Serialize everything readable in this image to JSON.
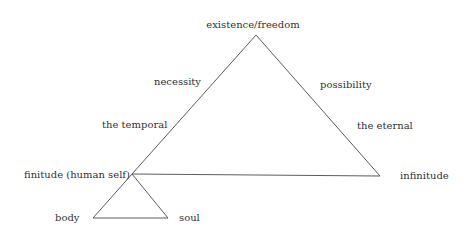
{
  "diagram": {
    "colors": {
      "line": "#4a4a4a",
      "text": "#333333",
      "background": "#ffffff"
    },
    "labels": {
      "apex": "existence/freedom",
      "left_upper": "necessity",
      "right_upper": "possibility",
      "left_lower": "the temporal",
      "right_lower": "the eternal",
      "finitude": "finitude (human self)",
      "infinitude": "infinitude",
      "body": "body",
      "soul": "soul"
    },
    "nodes": [
      {
        "id": "existence",
        "label": "existence/freedom",
        "x": 256,
        "y": 35
      },
      {
        "id": "finitude",
        "label": "finitude (human self)",
        "x": 132,
        "y": 174
      },
      {
        "id": "infinitude",
        "label": "infinitude",
        "x": 380,
        "y": 176
      },
      {
        "id": "body",
        "label": "body",
        "x": 93,
        "y": 218
      },
      {
        "id": "soul",
        "label": "soul",
        "x": 168,
        "y": 218
      }
    ],
    "edges": [
      {
        "from": "existence",
        "to": "finitude",
        "labels": [
          "necessity",
          "the temporal"
        ]
      },
      {
        "from": "existence",
        "to": "infinitude",
        "labels": [
          "possibility",
          "the eternal"
        ]
      },
      {
        "from": "finitude",
        "to": "infinitude"
      },
      {
        "from": "finitude",
        "to": "body"
      },
      {
        "from": "finitude",
        "to": "soul"
      },
      {
        "from": "body",
        "to": "soul"
      }
    ]
  }
}
